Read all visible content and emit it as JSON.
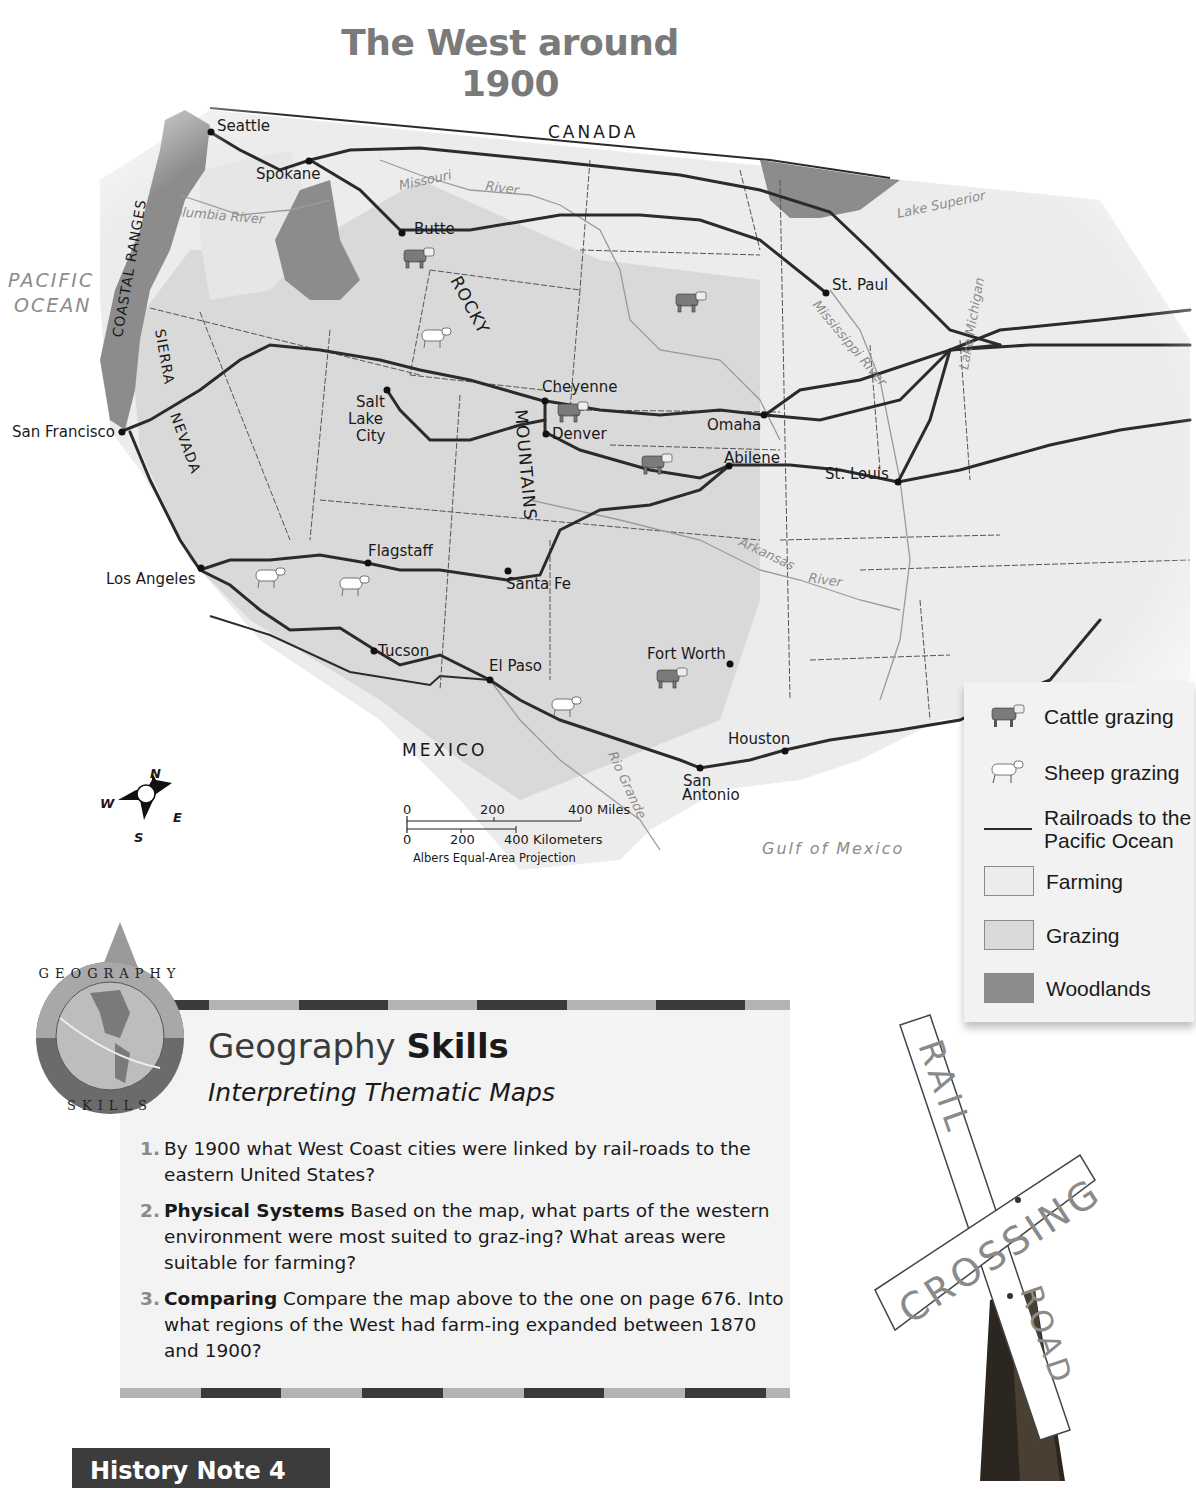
{
  "title": "The West around 1900",
  "map": {
    "regions": {
      "canada": "CANADA",
      "mexico": "MEXICO",
      "pacific_ocean_line1": "PACIFIC",
      "pacific_ocean_line2": "OCEAN",
      "gulf": "Gulf of Mexico"
    },
    "mountains": {
      "coastal_ranges": "COASTAL RANGES",
      "sierra": "SIERRA",
      "nevada": "NEVADA",
      "rocky": "ROCKY",
      "mountains": "MOUNTAINS"
    },
    "rivers": {
      "missouri": "Missouri",
      "river": "River",
      "columbia": "Columbia River",
      "mississippi": "Mississippi River",
      "arkansas": "Arkansas",
      "arkansas_river": "River",
      "rio_grande": "Rio Grande",
      "lake_superior": "Lake Superior",
      "lake_michigan": "Lake Michigan"
    },
    "cities": [
      {
        "name": "Seattle"
      },
      {
        "name": "Spokane"
      },
      {
        "name": "Butte"
      },
      {
        "name": "St. Paul"
      },
      {
        "name": "San Francisco"
      },
      {
        "name": "Salt"
      },
      {
        "name": "Lake"
      },
      {
        "name": "City"
      },
      {
        "name": "Cheyenne"
      },
      {
        "name": "Denver"
      },
      {
        "name": "Omaha"
      },
      {
        "name": "Abilene"
      },
      {
        "name": "St. Louis"
      },
      {
        "name": "Los Angeles"
      },
      {
        "name": "Flagstaff"
      },
      {
        "name": "Santa Fe"
      },
      {
        "name": "Tucson"
      },
      {
        "name": "El Paso"
      },
      {
        "name": "Fort Worth"
      },
      {
        "name": "Houston"
      },
      {
        "name": "San"
      },
      {
        "name": "Antonio"
      }
    ],
    "compass": {
      "n": "N",
      "s": "S",
      "e": "E",
      "w": "W"
    },
    "scale": {
      "miles": [
        "0",
        "200",
        "400 Miles"
      ],
      "km": [
        "0",
        "200",
        "400 Kilometers"
      ],
      "projection": "Albers Equal-Area Projection"
    },
    "colors": {
      "farming": "#ececec",
      "grazing": "#d9d9d9",
      "woodlands": "#8c8c8c",
      "railroad": "#2b2b2b"
    }
  },
  "legend": {
    "items": [
      {
        "label": "Cattle grazing",
        "icon": "cattle-icon"
      },
      {
        "label": "Sheep grazing",
        "icon": "sheep-icon"
      },
      {
        "label_line1": "Railroads to the",
        "label_line2": "Pacific Ocean",
        "icon": "railroad-line-icon"
      },
      {
        "label": "Farming",
        "color": "#ececec"
      },
      {
        "label": "Grazing",
        "color": "#d9d9d9"
      },
      {
        "label": "Woodlands",
        "color": "#8c8c8c"
      }
    ]
  },
  "skills": {
    "badge_top": "GEOGRAPHY",
    "badge_bottom": "SKILLS",
    "title_regular": "Geography ",
    "title_bold": "Skills",
    "subtitle": "Interpreting Thematic Maps",
    "questions": [
      {
        "num": "1.",
        "bold": "",
        "text": "By 1900 what West Coast cities were linked by rail-roads to the eastern United States?"
      },
      {
        "num": "2.",
        "bold": "Physical Systems",
        "text": " Based on the map, what parts of the western environment were most suited to graz-ing? What areas were suitable for farming?"
      },
      {
        "num": "3.",
        "bold": "Comparing",
        "text": " Compare the map above to the one on page 676. Into what regions of the West had farm-ing expanded between 1870 and 1900?"
      }
    ]
  },
  "history_note": "History Note 4",
  "photo": {
    "sign_rail": "RAIL",
    "sign_road": "ROAD",
    "sign_crossing": "CROSSING"
  }
}
